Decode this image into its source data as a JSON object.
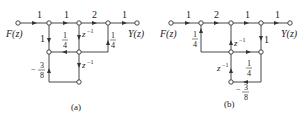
{
  "diagrams": [
    {
      "id": "a",
      "caption": "(a)",
      "input_label": "F(z)",
      "output_label": "Y(z)",
      "gains": {
        "f_to_a": "1",
        "a_to_b": "1",
        "b_to_c": "2",
        "c_to_y": "1",
        "a_to_d": "1",
        "e_to_d_num": "1",
        "e_to_d_den": "4",
        "b_to_e": "z",
        "b_to_e_exp": "−1",
        "c_up_num": "1",
        "c_up_den": "4",
        "e_to_g": "z",
        "e_to_g_exp": "−1",
        "g_to_d_sign": "−",
        "g_to_d_num": "3",
        "g_to_d_den": "8"
      }
    },
    {
      "id": "b",
      "caption": "(b)",
      "input_label": "F(z)",
      "output_label": "Y(z)",
      "gains": {
        "f_to_a": "1",
        "a_to_b": "2",
        "b_to_c": "1",
        "c_to_y": "1",
        "d_to_a_num": "1",
        "d_to_a_den": "4",
        "b_to_d": "z",
        "b_to_d_exp": "−1",
        "c_to_e": "1",
        "d_to_e_num": "1",
        "d_to_e_den": "4",
        "g_to_d": "z",
        "g_to_d_exp": "−1",
        "e_to_g_sign": "−",
        "e_to_g_num": "3",
        "e_to_g_den": "8"
      }
    }
  ],
  "colors": {
    "line": "#333333",
    "node_fill": "#ffffff",
    "text": "#222222"
  }
}
